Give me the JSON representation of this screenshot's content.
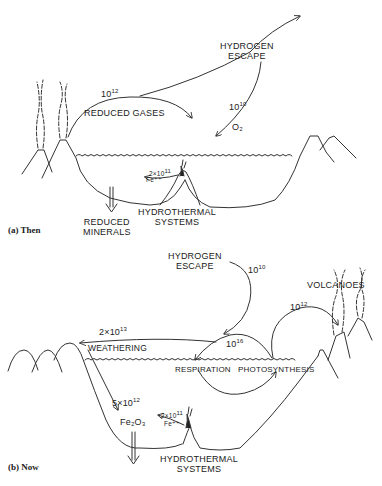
{
  "panel_a": {
    "label": "(a) Then",
    "labels": {
      "hydrogen_escape_1": "HYDROGEN",
      "hydrogen_escape_2": "ESCAPE",
      "reduced_gases": "REDUCED GASES",
      "flux_reduced_gases": "10",
      "flux_reduced_gases_exp": "12",
      "flux_o2": "10",
      "flux_o2_exp": "10",
      "o2": "O₂",
      "fe_flux": "2×10",
      "fe_flux_exp": "11",
      "fe_species": "Fe⁺⁺",
      "hydrothermal_1": "HYDROTHERMAL",
      "hydrothermal_2": "SYSTEMS",
      "reduced_minerals_1": "REDUCED",
      "reduced_minerals_2": "MINERALS"
    }
  },
  "panel_b": {
    "label": "(b) Now",
    "labels": {
      "hydrogen_escape_1": "HYDROGEN",
      "hydrogen_escape_2": "ESCAPE",
      "flux_hydrogen": "10",
      "flux_hydrogen_exp": "10",
      "volcanoes": "VOLCANOES",
      "flux_volcanoes": "10",
      "flux_volcanoes_exp": "12",
      "flux_weathering": "2×10",
      "flux_weathering_exp": "13",
      "weathering": "WEATHERING",
      "flux_bio": "10",
      "flux_bio_exp": "16",
      "respiration": "RESPIRATION",
      "photosynthesis": "PHOTOSYNTHESIS",
      "flux_fe2o3": "5×10",
      "flux_fe2o3_exp": "12",
      "fe2o3": "Fe₂O₃",
      "fe_flux": "2×10",
      "fe_flux_exp": "11",
      "fe_species": "Fe⁺⁺",
      "hydrothermal_1": "HYDROTHERMAL",
      "hydrothermal_2": "SYSTEMS"
    }
  }
}
